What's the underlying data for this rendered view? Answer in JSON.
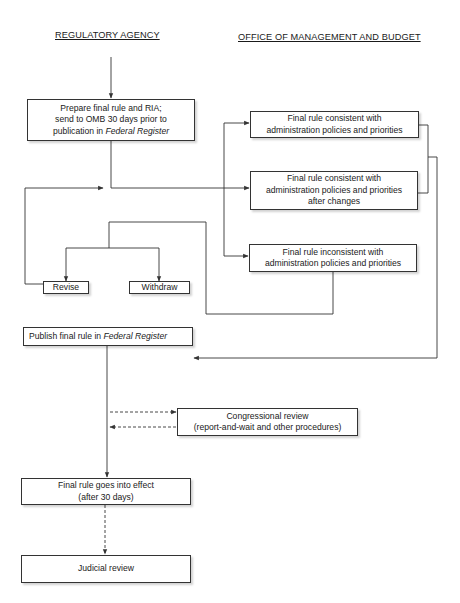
{
  "headers": {
    "left": "REGULATORY AGENCY",
    "right": "OFFICE OF MANAGEMENT AND BUDGET"
  },
  "nodes": {
    "prepare": {
      "line1": "Prepare final rule and RIA;",
      "line2": "send to OMB 30 days prior to",
      "line3_prefix": "publication in ",
      "line3_italic": "Federal Register"
    },
    "consistent": {
      "line1": "Final rule consistent with",
      "line2": "administration policies and priorities"
    },
    "consistent_after_changes": {
      "line1": "Final rule consistent with",
      "line2": "administration policies and priorities",
      "line3": "after changes"
    },
    "inconsistent": {
      "line1": "Final rule inconsistent with",
      "line2": "administration policies and priorities"
    },
    "revise": {
      "label": "Revise"
    },
    "withdraw": {
      "label": "Withdraw"
    },
    "publish": {
      "prefix": "Publish final rule in ",
      "italic": "Federal Register"
    },
    "congressional": {
      "line1": "Congressional review",
      "line2": "(report-and-wait and other procedures)"
    },
    "effect": {
      "line1": "Final rule goes into effect",
      "line2": "(after 30 days)"
    },
    "judicial": {
      "label": "Judicial review"
    }
  },
  "edges": [
    {
      "from": "start",
      "to": "prepare",
      "style": "solid"
    },
    {
      "from": "prepare",
      "to": "consistent",
      "style": "solid"
    },
    {
      "from": "prepare",
      "to": "consistent_after_changes",
      "style": "solid"
    },
    {
      "from": "prepare",
      "to": "inconsistent",
      "style": "solid"
    },
    {
      "from": "inconsistent",
      "to": "revise",
      "style": "solid"
    },
    {
      "from": "inconsistent",
      "to": "withdraw",
      "style": "solid"
    },
    {
      "from": "revise",
      "to": "prepare",
      "style": "solid"
    },
    {
      "from": "consistent",
      "to": "publish",
      "style": "solid"
    },
    {
      "from": "consistent_after_changes",
      "to": "publish",
      "style": "solid"
    },
    {
      "from": "publish",
      "to": "congressional",
      "style": "dashed"
    },
    {
      "from": "congressional",
      "to": "publish",
      "style": "dashed"
    },
    {
      "from": "publish",
      "to": "effect",
      "style": "solid"
    },
    {
      "from": "effect",
      "to": "judicial",
      "style": "dashed"
    }
  ],
  "colors": {
    "line": "#333333",
    "background": "#ffffff",
    "text": "#1a1a1a"
  }
}
